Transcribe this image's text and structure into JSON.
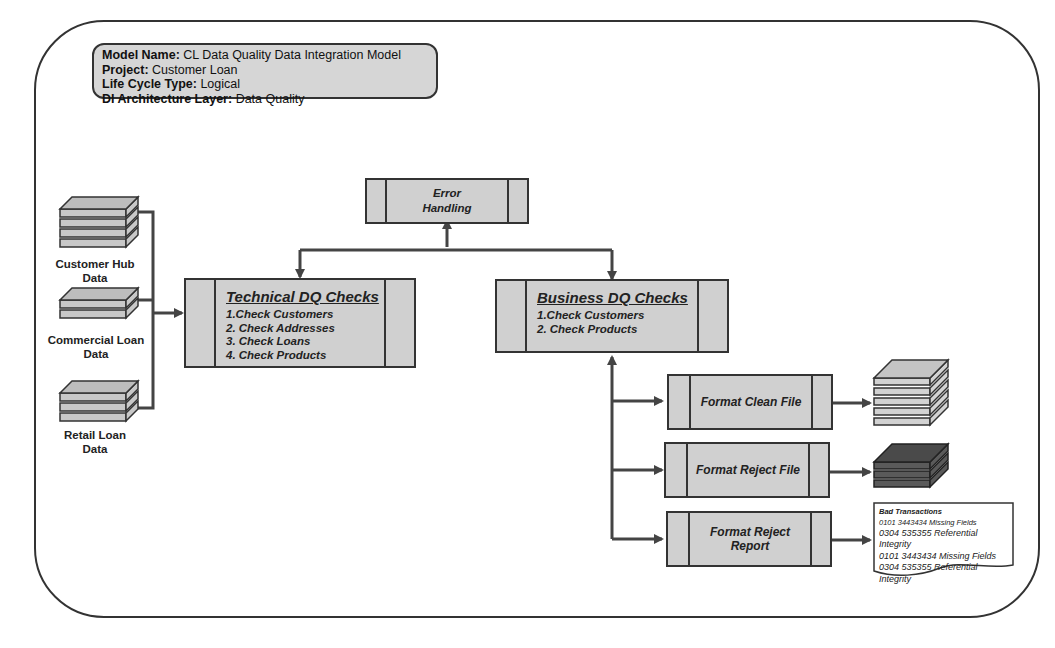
{
  "model_info": {
    "model_name_label": "Model Name:",
    "model_name": "CL Data Quality Data Integration Model",
    "project_label": "Project:",
    "project": "Customer Loan",
    "life_cycle_label": "Life Cycle Type:",
    "life_cycle": "Logical",
    "layer_label": "DI Architecture Layer:",
    "layer": "Data Quality"
  },
  "sources": [
    {
      "label_line1": "Customer Hub",
      "label_line2": "Data"
    },
    {
      "label_line1": "Commercial Loan",
      "label_line2": "Data"
    },
    {
      "label_line1": "Retail Loan",
      "label_line2": "Data"
    }
  ],
  "error_handling": {
    "line1": "Error",
    "line2": "Handling"
  },
  "technical_checks": {
    "title": "Technical  DQ Checks",
    "items": [
      "1.Check Customers",
      "2. Check Addresses",
      "3. Check Loans",
      "4. Check Products"
    ]
  },
  "business_checks": {
    "title": "Business  DQ Checks",
    "items": [
      "1.Check Customers",
      "2. Check Products"
    ]
  },
  "outputs": {
    "clean": "Format Clean File",
    "reject": "Format Reject File",
    "report": "Format Reject Report"
  },
  "reject_report": {
    "title": "Bad Transactions",
    "lines": [
      "0101 3443434 Missing Fields",
      "0304 535355 Referential Integrity",
      "0101 3443434 Missing Fields",
      "0304 535355 Referential Integrity"
    ]
  },
  "colors": {
    "box_fill": "#d0d0d0",
    "line": "#333333",
    "reject_file": "#555555"
  }
}
